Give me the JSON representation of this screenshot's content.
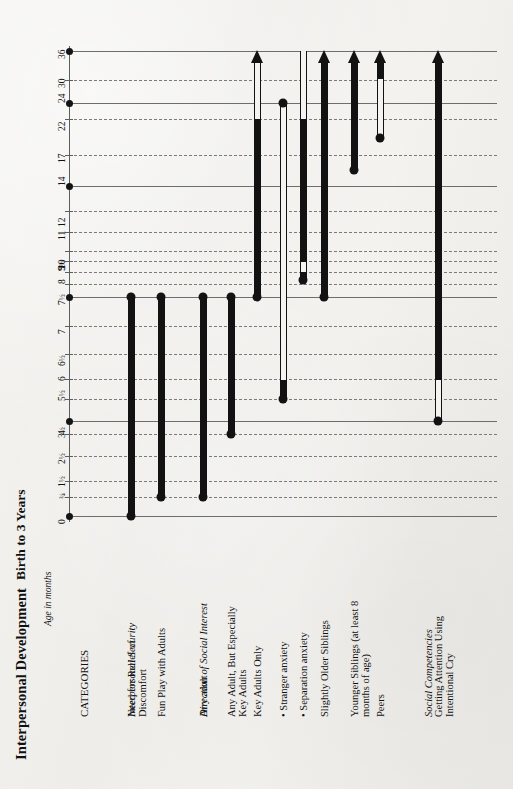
{
  "doc": {
    "title": "Interpersonal Development",
    "subtitle": "Birth to 3 Years",
    "axis_title": "Age in months",
    "categories_header": "CATEGORIES"
  },
  "colors": {
    "paper": "#f2f1ee",
    "ink": "#121212",
    "grid_solid": "#6d6d6d",
    "grid_dash": "#7a7a7a",
    "axis": "#5d5d5d"
  },
  "axis": {
    "label": "Age in months",
    "unit": "months",
    "ticks": [
      {
        "label": "0",
        "value": 0,
        "major": true,
        "y": 516
      },
      {
        "label": "3/4",
        "value": 0.75,
        "major": false,
        "y": 497
      },
      {
        "label": "1½",
        "value": 1.5,
        "major": false,
        "y": 481
      },
      {
        "label": "2½",
        "value": 2.5,
        "major": false,
        "y": 456
      },
      {
        "label": "3½",
        "value": 3.5,
        "major": false,
        "y": 434
      },
      {
        "label": "4",
        "value": 4,
        "major": true,
        "y": 421
      },
      {
        "label": "5½",
        "value": 5.5,
        "major": false,
        "y": 399
      },
      {
        "label": "6",
        "value": 6,
        "major": false,
        "y": 379
      },
      {
        "label": "6½",
        "value": 6.5,
        "major": false,
        "y": 354
      },
      {
        "label": "7",
        "value": 7,
        "major": false,
        "y": 326
      },
      {
        "label": "7½",
        "value": 7.5,
        "major": true,
        "y": 297
      },
      {
        "label": "8",
        "value": 8,
        "major": false,
        "y": 284
      },
      {
        "label": "9",
        "value": 9,
        "major": false,
        "y": 272
      },
      {
        "label": "9½",
        "value": 9.5,
        "major": false,
        "y": 261
      },
      {
        "label": "10",
        "value": 10,
        "major": false,
        "y": 251
      },
      {
        "label": "11",
        "value": 11,
        "major": false,
        "y": 232
      },
      {
        "label": "12",
        "value": 12,
        "major": false,
        "y": 211
      },
      {
        "label": "14",
        "value": 14,
        "major": true,
        "y": 186
      },
      {
        "label": "17",
        "value": 17,
        "major": false,
        "y": 155
      },
      {
        "label": "22",
        "value": 22,
        "major": false,
        "y": 119
      },
      {
        "label": "24",
        "value": 24,
        "major": true,
        "y": 103
      },
      {
        "label": "30",
        "value": 30,
        "major": false,
        "y": 80
      },
      {
        "label": "36",
        "value": 36,
        "major": true,
        "y": 51
      }
    ]
  },
  "groups": [
    {
      "name": "Interpersonal Security",
      "italic": true,
      "x": 131
    },
    {
      "name": "Direction of Social Interest",
      "italic": true,
      "x": 203
    },
    {
      "name": "Social Competencies",
      "italic": true,
      "x": 428
    }
  ],
  "series": [
    {
      "label": "Need for Relief of Discomfort",
      "label_lines": [
        "Need for Relief of",
        "Discomfort"
      ],
      "x": 131,
      "start": {
        "label": "0",
        "y": 516
      },
      "end": {
        "label": "7½",
        "y": 297
      },
      "start_dot": true,
      "end_dot": true,
      "arrow": false,
      "segments": [
        {
          "kind": "filled",
          "from_y": 297,
          "to_y": 516
        }
      ]
    },
    {
      "label": "Fun Play with Adults",
      "label_lines": [
        "Fun Play with Adults"
      ],
      "x": 161,
      "start": {
        "label": "¾",
        "y": 497
      },
      "end": {
        "label": "7½",
        "y": 297
      },
      "start_dot": true,
      "end_dot": true,
      "arrow": false,
      "segments": [
        {
          "kind": "filled",
          "from_y": 297,
          "to_y": 497
        }
      ]
    },
    {
      "label": "Any adult",
      "label_lines": [
        "Any adult"
      ],
      "x": 203,
      "start": {
        "label": "¾",
        "y": 497
      },
      "end": {
        "label": "7½",
        "y": 297
      },
      "start_dot": true,
      "end_dot": true,
      "arrow": false,
      "segments": [
        {
          "kind": "filled",
          "from_y": 297,
          "to_y": 497
        }
      ]
    },
    {
      "label": "Any Adult, But Especially Key Adults",
      "label_lines": [
        "Any Adult, But Especially",
        "Key Adults"
      ],
      "x": 231,
      "start": {
        "label": "3½",
        "y": 434
      },
      "end": {
        "label": "7½",
        "y": 297
      },
      "start_dot": true,
      "end_dot": true,
      "arrow": false,
      "segments": [
        {
          "kind": "filled",
          "from_y": 297,
          "to_y": 434
        }
      ]
    },
    {
      "label": "Key Adults Only",
      "label_lines": [
        "Key Adults Only"
      ],
      "x": 257,
      "start": {
        "label": "7½",
        "y": 297
      },
      "end": {
        "label": "beyond 36",
        "y": 51
      },
      "start_dot": true,
      "end_dot": false,
      "arrow": true,
      "segments": [
        {
          "kind": "filled",
          "from_y": 119,
          "to_y": 297
        },
        {
          "kind": "hollow",
          "from_y": 63,
          "to_y": 119
        }
      ]
    },
    {
      "label": "Stranger anxiety",
      "label_lines": [
        "• Stranger anxiety"
      ],
      "x": 283,
      "start": {
        "label": "5½",
        "y": 399
      },
      "end": {
        "label": "24",
        "y": 103
      },
      "start_dot": true,
      "end_dot": true,
      "arrow": false,
      "segments": [
        {
          "kind": "hollow",
          "from_y": 103,
          "to_y": 380
        },
        {
          "kind": "filled",
          "from_y": 380,
          "to_y": 399
        }
      ]
    },
    {
      "label": "Separation anxiety",
      "label_lines": [
        "• Separation anxiety"
      ],
      "x": 303,
      "start": {
        "label": "8½",
        "y": 280
      },
      "end": {
        "label": "30+",
        "y": 51
      },
      "start_dot": true,
      "end_dot": false,
      "arrow": false,
      "segments": [
        {
          "kind": "filled",
          "from_y": 119,
          "to_y": 262
        },
        {
          "kind": "hollow",
          "from_y": 262,
          "to_y": 272
        },
        {
          "kind": "filled",
          "from_y": 272,
          "to_y": 280
        },
        {
          "kind": "hollow",
          "from_y": 51,
          "to_y": 119
        }
      ]
    },
    {
      "label": "Slightly Older Siblings",
      "label_lines": [
        "Slightly Older Siblings"
      ],
      "x": 324,
      "start": {
        "label": "7½",
        "y": 297
      },
      "end": {
        "label": "beyond 36",
        "y": 51
      },
      "start_dot": true,
      "end_dot": false,
      "arrow": true,
      "segments": [
        {
          "kind": "filled",
          "from_y": 63,
          "to_y": 297
        }
      ]
    },
    {
      "label": "Younger Siblings (at least 8 months of age)",
      "label_lines": [
        "Younger Siblings (at least 8",
        "months of age)"
      ],
      "x": 354,
      "start": {
        "label": "17",
        "y": 170
      },
      "end": {
        "label": "beyond 36",
        "y": 51
      },
      "start_dot": true,
      "end_dot": false,
      "arrow": true,
      "segments": [
        {
          "kind": "filled",
          "from_y": 63,
          "to_y": 170
        }
      ]
    },
    {
      "label": "Peers",
      "label_lines": [
        "Peers"
      ],
      "x": 380,
      "start": {
        "label": "22",
        "y": 138
      },
      "end": {
        "label": "beyond 36",
        "y": 51
      },
      "start_dot": true,
      "end_dot": false,
      "arrow": true,
      "segments": [
        {
          "kind": "hollow",
          "from_y": 79,
          "to_y": 138
        },
        {
          "kind": "filled",
          "from_y": 63,
          "to_y": 79
        }
      ]
    },
    {
      "label": "Getting Attention Using Intentional Cry",
      "label_lines": [
        "Getting Attention Using",
        "Intentional Cry"
      ],
      "x": 438,
      "start": {
        "label": "4",
        "y": 421
      },
      "end": {
        "label": "beyond 36",
        "y": 51
      },
      "start_dot": true,
      "end_dot": false,
      "arrow": true,
      "segments": [
        {
          "kind": "hollow",
          "from_y": 380,
          "to_y": 421
        },
        {
          "kind": "filled",
          "from_y": 63,
          "to_y": 380
        }
      ]
    }
  ],
  "chart_data": {
    "type": "bar",
    "title": "Interpersonal Development",
    "subtitle": "Birth to 3 Years",
    "xlabel": "",
    "ylabel": "Age in months",
    "orientation": "horizontal-rotated",
    "ylim": [
      0,
      36
    ],
    "grid": true,
    "legend": "none",
    "categories": [
      "Need for Relief of Discomfort",
      "Fun Play with Adults",
      "Any adult",
      "Any Adult, But Especially Key Adults",
      "Key Adults Only",
      "Stranger anxiety",
      "Separation anxiety",
      "Slightly Older Siblings",
      "Younger Siblings (at least 8 months of age)",
      "Peers",
      "Getting Attention Using Intentional Cry"
    ],
    "tick_labels": [
      "0",
      "3/4",
      "1½",
      "2½",
      "3½",
      "4",
      "5½",
      "6",
      "6½",
      "7",
      "7½",
      "8",
      "9",
      "9½",
      "10",
      "11",
      "12",
      "14",
      "17",
      "22",
      "24",
      "30",
      "36"
    ],
    "series": [
      {
        "name": "Need for Relief of Discomfort",
        "start_months": 0,
        "end_months": 7.5,
        "continues": false
      },
      {
        "name": "Fun Play with Adults",
        "start_months": 0.75,
        "end_months": 7.5,
        "continues": false
      },
      {
        "name": "Any adult",
        "start_months": 0.75,
        "end_months": 7.5,
        "continues": false
      },
      {
        "name": "Any Adult, But Especially Key Adults",
        "start_months": 3.5,
        "end_months": 7.5,
        "continues": false
      },
      {
        "name": "Key Adults Only",
        "start_months": 7.5,
        "end_months": 36,
        "continues": true
      },
      {
        "name": "Stranger anxiety",
        "start_months": 5.5,
        "end_months": 24,
        "continues": false
      },
      {
        "name": "Separation anxiety",
        "start_months": 8.5,
        "end_months": 36,
        "continues": false
      },
      {
        "name": "Slightly Older Siblings",
        "start_months": 7.5,
        "end_months": 36,
        "continues": true
      },
      {
        "name": "Younger Siblings (at least 8 months of age)",
        "start_months": 15,
        "end_months": 36,
        "continues": true
      },
      {
        "name": "Peers",
        "start_months": 22,
        "end_months": 36,
        "continues": true
      },
      {
        "name": "Getting Attention Using Intentional Cry",
        "start_months": 4,
        "end_months": 36,
        "continues": true
      }
    ]
  }
}
